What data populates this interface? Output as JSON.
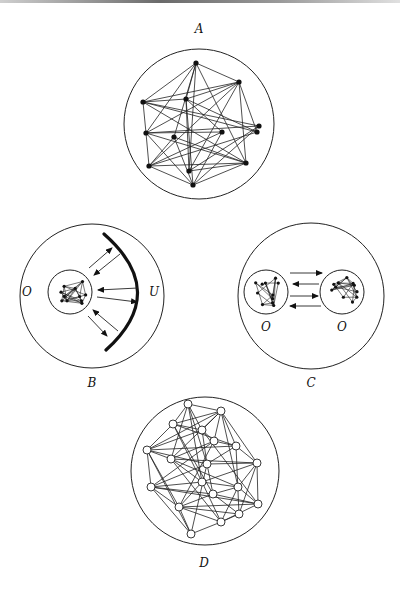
{
  "figure": {
    "panels": [
      {
        "id": "A",
        "label": "A",
        "label_pos": [
          199,
          33
        ],
        "circle": {
          "cx": 199,
          "cy": 124,
          "r": 75
        },
        "nodes": [
          [
            196,
            63
          ],
          [
            239,
            82
          ],
          [
            143,
            102
          ],
          [
            186,
            99
          ],
          [
            146,
            133
          ],
          [
            174,
            137
          ],
          [
            222,
            132
          ],
          [
            259,
            126
          ],
          [
            257,
            132
          ],
          [
            149,
            166
          ],
          [
            189,
            171
          ],
          [
            246,
            163
          ],
          [
            193,
            185
          ]
        ],
        "edges": [
          [
            0,
            1
          ],
          [
            0,
            2
          ],
          [
            0,
            4
          ],
          [
            0,
            5
          ],
          [
            0,
            10
          ],
          [
            0,
            11
          ],
          [
            0,
            3
          ],
          [
            1,
            2
          ],
          [
            1,
            3
          ],
          [
            1,
            4
          ],
          [
            1,
            9
          ],
          [
            1,
            8
          ],
          [
            1,
            11
          ],
          [
            1,
            10
          ],
          [
            2,
            3
          ],
          [
            2,
            7
          ],
          [
            2,
            8
          ],
          [
            2,
            11
          ],
          [
            3,
            10
          ],
          [
            3,
            12
          ],
          [
            3,
            6
          ],
          [
            3,
            8
          ],
          [
            4,
            6
          ],
          [
            4,
            7
          ],
          [
            4,
            12
          ],
          [
            4,
            11
          ],
          [
            4,
            9
          ],
          [
            5,
            9
          ],
          [
            5,
            11
          ],
          [
            5,
            12
          ],
          [
            6,
            9
          ],
          [
            6,
            12
          ],
          [
            7,
            10
          ],
          [
            7,
            12
          ],
          [
            8,
            9
          ],
          [
            9,
            11
          ],
          [
            9,
            12
          ],
          [
            10,
            11
          ],
          [
            11,
            12
          ],
          [
            2,
            4
          ]
        ],
        "node_style": "filled"
      },
      {
        "id": "B",
        "label": "B",
        "label_pos": [
          92,
          387
        ],
        "circle": {
          "cx": 92,
          "cy": 296,
          "r": 72
        },
        "inner": [
          {
            "cx": 70,
            "cy": 292,
            "r": 22,
            "label": "O",
            "label_pos": [
              27,
              296
            ]
          }
        ],
        "arc_label": "U",
        "arc_label_pos": [
          154,
          296
        ]
      },
      {
        "id": "C",
        "label": "C",
        "label_pos": [
          311,
          387
        ],
        "circle": {
          "cx": 311,
          "cy": 296,
          "r": 73
        },
        "inner": [
          {
            "cx": 266,
            "cy": 292,
            "r": 22,
            "label": "O",
            "label_pos": [
              266,
              331
            ]
          },
          {
            "cx": 342,
            "cy": 292,
            "r": 22,
            "label": "O",
            "label_pos": [
              342,
              331
            ]
          }
        ]
      },
      {
        "id": "D",
        "label": "D",
        "label_pos": [
          204,
          567
        ],
        "circle": {
          "cx": 205,
          "cy": 471,
          "r": 74
        },
        "nodes": [
          [
            188,
            404
          ],
          [
            221,
            411
          ],
          [
            173,
            424
          ],
          [
            202,
            430
          ],
          [
            214,
            441
          ],
          [
            236,
            446
          ],
          [
            147,
            450
          ],
          [
            171,
            459
          ],
          [
            207,
            464
          ],
          [
            257,
            463
          ],
          [
            202,
            482
          ],
          [
            151,
            487
          ],
          [
            238,
            487
          ],
          [
            213,
            494
          ],
          [
            258,
            504
          ],
          [
            179,
            507
          ],
          [
            239,
            514
          ],
          [
            221,
            522
          ],
          [
            191,
            534
          ]
        ],
        "edges": [
          [
            0,
            1
          ],
          [
            0,
            2
          ],
          [
            0,
            3
          ],
          [
            0,
            7
          ],
          [
            0,
            8
          ],
          [
            0,
            10
          ],
          [
            1,
            2
          ],
          [
            1,
            3
          ],
          [
            1,
            4
          ],
          [
            1,
            5
          ],
          [
            1,
            6
          ],
          [
            1,
            7
          ],
          [
            1,
            9
          ],
          [
            1,
            12
          ],
          [
            2,
            3
          ],
          [
            2,
            6
          ],
          [
            2,
            5
          ],
          [
            2,
            10
          ],
          [
            2,
            13
          ],
          [
            3,
            4
          ],
          [
            3,
            6
          ],
          [
            3,
            8
          ],
          [
            3,
            14
          ],
          [
            4,
            5
          ],
          [
            4,
            7
          ],
          [
            4,
            11
          ],
          [
            4,
            15
          ],
          [
            5,
            6
          ],
          [
            5,
            9
          ],
          [
            5,
            8
          ],
          [
            5,
            16
          ],
          [
            6,
            7
          ],
          [
            6,
            8
          ],
          [
            6,
            11
          ],
          [
            6,
            15
          ],
          [
            6,
            18
          ],
          [
            7,
            9
          ],
          [
            7,
            10
          ],
          [
            7,
            12
          ],
          [
            7,
            17
          ],
          [
            8,
            9
          ],
          [
            8,
            11
          ],
          [
            8,
            13
          ],
          [
            8,
            18
          ],
          [
            9,
            10
          ],
          [
            9,
            12
          ],
          [
            9,
            14
          ],
          [
            9,
            16
          ],
          [
            10,
            11
          ],
          [
            10,
            12
          ],
          [
            10,
            15
          ],
          [
            10,
            17
          ],
          [
            11,
            13
          ],
          [
            11,
            15
          ],
          [
            11,
            18
          ],
          [
            12,
            13
          ],
          [
            12,
            14
          ],
          [
            12,
            17
          ],
          [
            13,
            15
          ],
          [
            13,
            16
          ],
          [
            13,
            14
          ],
          [
            14,
            15
          ],
          [
            14,
            17
          ],
          [
            15,
            16
          ],
          [
            15,
            18
          ],
          [
            15,
            17
          ],
          [
            16,
            17
          ],
          [
            17,
            18
          ],
          [
            11,
            14
          ]
        ],
        "node_style": "open"
      }
    ]
  }
}
